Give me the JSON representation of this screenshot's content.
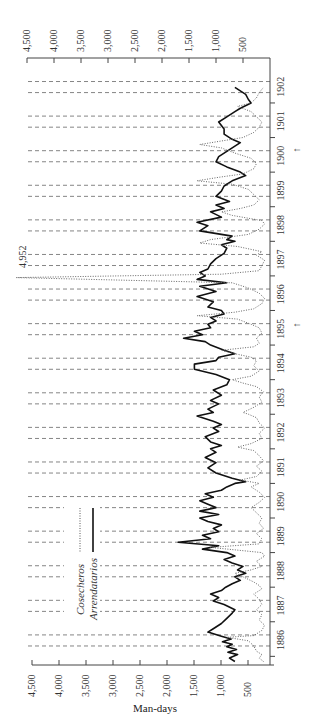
{
  "chart_data": {
    "type": "line",
    "orientation": "rotated-90 (time runs bottom-to-top, values increase right-to-left)",
    "title": "",
    "xlabel": "",
    "ylabel": "Man-days",
    "value_axis": {
      "label": "Man-days",
      "range": [
        0,
        4500
      ],
      "ticks": [
        4500,
        4000,
        3500,
        3000,
        2500,
        2000,
        1500,
        1000,
        500
      ],
      "tick_labels": [
        "4,500",
        "4,000",
        "3,500",
        "3,000",
        "2,500",
        "2,000",
        "1,500",
        "1,000",
        "500"
      ]
    },
    "time_axis": {
      "categories": [
        "1886",
        "1887",
        "1888",
        "1889",
        "1890",
        "1891",
        "1892",
        "1893",
        "1894",
        "1895",
        "1896",
        "1897",
        "1898",
        "1899",
        "1900",
        "1901",
        "1902"
      ],
      "range": [
        1885.75,
        1903.3
      ]
    },
    "grid": "dashed reference lines in pairs within each year",
    "legend": {
      "position": "inside, lower-left",
      "entries": [
        {
          "name": "Cosecheros",
          "style": "dotted"
        },
        {
          "name": "Arrendatarios",
          "style": "solid"
        }
      ]
    },
    "annotations": [
      {
        "text": "4,952",
        "at_year": 1897.0,
        "note": "Cosecheros peak off-scale"
      },
      {
        "text": "↑",
        "at_year": 1894.6,
        "note": "marker below 1895"
      },
      {
        "text": "↑",
        "at_year": 1900.2,
        "note": "marker near 1900"
      }
    ],
    "series": [
      {
        "name": "Arrendatarios",
        "style": "solid",
        "points": [
          [
            1885.85,
            650
          ],
          [
            1885.95,
            750
          ],
          [
            1886.05,
            600
          ],
          [
            1886.12,
            780
          ],
          [
            1886.2,
            620
          ],
          [
            1886.28,
            800
          ],
          [
            1886.35,
            700
          ],
          [
            1886.42,
            880
          ],
          [
            1886.5,
            720
          ],
          [
            1886.58,
            900
          ],
          [
            1886.7,
            1150
          ],
          [
            1886.8,
            1050
          ],
          [
            1886.95,
            900
          ],
          [
            1887.1,
            800
          ],
          [
            1887.25,
            700
          ],
          [
            1887.35,
            650
          ],
          [
            1887.5,
            850
          ],
          [
            1887.6,
            1050
          ],
          [
            1887.7,
            950
          ],
          [
            1887.8,
            1100
          ],
          [
            1887.9,
            900
          ],
          [
            1888.0,
            820
          ],
          [
            1888.1,
            700
          ],
          [
            1888.2,
            550
          ],
          [
            1888.3,
            650
          ],
          [
            1888.4,
            450
          ],
          [
            1888.5,
            600
          ],
          [
            1888.6,
            500
          ],
          [
            1888.7,
            700
          ],
          [
            1888.8,
            850
          ],
          [
            1888.9,
            650
          ],
          [
            1889.0,
            800
          ],
          [
            1889.1,
            1250
          ],
          [
            1889.2,
            950
          ],
          [
            1889.3,
            1700
          ],
          [
            1889.4,
            1100
          ],
          [
            1889.5,
            1250
          ],
          [
            1889.6,
            950
          ],
          [
            1889.7,
            1050
          ],
          [
            1889.8,
            900
          ],
          [
            1889.9,
            1150
          ],
          [
            1890.0,
            1300
          ],
          [
            1890.1,
            950
          ],
          [
            1890.2,
            1300
          ],
          [
            1890.3,
            1000
          ],
          [
            1890.4,
            1150
          ],
          [
            1890.5,
            1300
          ],
          [
            1890.6,
            1050
          ],
          [
            1890.7,
            1200
          ],
          [
            1890.8,
            900
          ],
          [
            1890.9,
            800
          ],
          [
            1891.0,
            650
          ],
          [
            1891.05,
            450
          ],
          [
            1891.15,
            700
          ],
          [
            1891.3,
            1000
          ],
          [
            1891.45,
            1150
          ],
          [
            1891.6,
            1000
          ],
          [
            1891.75,
            1200
          ],
          [
            1891.9,
            1000
          ],
          [
            1892.0,
            1100
          ],
          [
            1892.1,
            900
          ],
          [
            1892.2,
            1100
          ],
          [
            1892.35,
            1200
          ],
          [
            1892.5,
            950
          ],
          [
            1892.6,
            1050
          ],
          [
            1892.7,
            900
          ],
          [
            1892.8,
            1050
          ],
          [
            1892.95,
            1350
          ],
          [
            1893.05,
            1050
          ],
          [
            1893.15,
            1150
          ],
          [
            1893.3,
            950
          ],
          [
            1893.4,
            1100
          ],
          [
            1893.55,
            900
          ],
          [
            1893.7,
            1050
          ],
          [
            1893.85,
            800
          ],
          [
            1894.0,
            750
          ],
          [
            1894.15,
            1000
          ],
          [
            1894.3,
            1400
          ],
          [
            1894.45,
            1400
          ],
          [
            1894.55,
            1000
          ],
          [
            1894.65,
            950
          ],
          [
            1894.75,
            650
          ],
          [
            1894.85,
            850
          ],
          [
            1895.0,
            1100
          ],
          [
            1895.1,
            1200
          ],
          [
            1895.2,
            1600
          ],
          [
            1895.3,
            1250
          ],
          [
            1895.4,
            1400
          ],
          [
            1895.5,
            1100
          ],
          [
            1895.6,
            1150
          ],
          [
            1895.7,
            1000
          ],
          [
            1895.8,
            1100
          ],
          [
            1895.9,
            850
          ],
          [
            1896.0,
            900
          ],
          [
            1896.1,
            1150
          ],
          [
            1896.25,
            1050
          ],
          [
            1896.4,
            1350
          ],
          [
            1896.55,
            1000
          ],
          [
            1896.7,
            1300
          ],
          [
            1896.8,
            800
          ],
          [
            1896.9,
            1350
          ],
          [
            1897.0,
            1200
          ],
          [
            1897.1,
            1300
          ],
          [
            1897.2,
            1150
          ],
          [
            1897.35,
            1100
          ],
          [
            1897.5,
            1000
          ],
          [
            1897.65,
            850
          ],
          [
            1897.8,
            800
          ],
          [
            1897.9,
            900
          ],
          [
            1898.0,
            650
          ],
          [
            1898.05,
            800
          ],
          [
            1898.15,
            700
          ],
          [
            1898.3,
            1300
          ],
          [
            1898.45,
            1150
          ],
          [
            1898.55,
            1350
          ],
          [
            1898.7,
            900
          ],
          [
            1898.85,
            1100
          ],
          [
            1898.95,
            850
          ],
          [
            1899.05,
            1000
          ],
          [
            1899.15,
            750
          ],
          [
            1899.3,
            1000
          ],
          [
            1899.45,
            900
          ],
          [
            1899.6,
            850
          ],
          [
            1899.75,
            700
          ],
          [
            1899.9,
            450
          ],
          [
            1900.0,
            550
          ],
          [
            1900.15,
            800
          ],
          [
            1900.3,
            1000
          ],
          [
            1900.45,
            950
          ],
          [
            1900.6,
            800
          ],
          [
            1900.7,
            700
          ],
          [
            1900.85,
            550
          ],
          [
            1900.95,
            700
          ],
          [
            1901.1,
            850
          ],
          [
            1901.25,
            850
          ],
          [
            1901.45,
            950
          ],
          [
            1901.6,
            800
          ],
          [
            1901.75,
            650
          ],
          [
            1901.85,
            550
          ],
          [
            1902.0,
            350
          ],
          [
            1902.1,
            400
          ],
          [
            1902.25,
            450
          ],
          [
            1902.45,
            650
          ]
        ]
      },
      {
        "name": "Cosecheros",
        "style": "dotted",
        "points": [
          [
            1885.85,
            120
          ],
          [
            1885.95,
            200
          ],
          [
            1886.05,
            150
          ],
          [
            1886.15,
            250
          ],
          [
            1886.3,
            300
          ],
          [
            1886.45,
            400
          ],
          [
            1886.55,
            800
          ],
          [
            1886.6,
            300
          ],
          [
            1886.75,
            150
          ],
          [
            1886.9,
            100
          ],
          [
            1887.05,
            200
          ],
          [
            1887.2,
            150
          ],
          [
            1887.35,
            250
          ],
          [
            1887.5,
            150
          ],
          [
            1887.65,
            200
          ],
          [
            1887.8,
            300
          ],
          [
            1887.95,
            150
          ],
          [
            1888.05,
            200
          ],
          [
            1888.15,
            300
          ],
          [
            1888.3,
            500
          ],
          [
            1888.4,
            650
          ],
          [
            1888.5,
            350
          ],
          [
            1888.6,
            150
          ],
          [
            1888.75,
            250
          ],
          [
            1888.9,
            100
          ],
          [
            1889.0,
            150
          ],
          [
            1889.15,
            1100
          ],
          [
            1889.25,
            200
          ],
          [
            1889.4,
            150
          ],
          [
            1889.55,
            250
          ],
          [
            1889.7,
            120
          ],
          [
            1889.85,
            200
          ],
          [
            1890.0,
            150
          ],
          [
            1890.15,
            250
          ],
          [
            1890.3,
            350
          ],
          [
            1890.45,
            200
          ],
          [
            1890.6,
            100
          ],
          [
            1890.75,
            200
          ],
          [
            1890.9,
            350
          ],
          [
            1891.0,
            200
          ],
          [
            1891.1,
            550
          ],
          [
            1891.2,
            250
          ],
          [
            1891.35,
            150
          ],
          [
            1891.5,
            250
          ],
          [
            1891.65,
            120
          ],
          [
            1891.8,
            200
          ],
          [
            1891.95,
            300
          ],
          [
            1892.05,
            600
          ],
          [
            1892.15,
            350
          ],
          [
            1892.3,
            150
          ],
          [
            1892.45,
            200
          ],
          [
            1892.6,
            100
          ],
          [
            1892.75,
            200
          ],
          [
            1892.9,
            250
          ],
          [
            1893.0,
            400
          ],
          [
            1893.05,
            500
          ],
          [
            1893.2,
            300
          ],
          [
            1893.35,
            150
          ],
          [
            1893.5,
            200
          ],
          [
            1893.65,
            120
          ],
          [
            1893.8,
            250
          ],
          [
            1893.9,
            500
          ],
          [
            1894.0,
            700
          ],
          [
            1894.1,
            350
          ],
          [
            1894.25,
            200
          ],
          [
            1894.4,
            300
          ],
          [
            1894.55,
            250
          ],
          [
            1894.65,
            350
          ],
          [
            1894.75,
            650
          ],
          [
            1894.85,
            900
          ],
          [
            1894.95,
            300
          ],
          [
            1895.05,
            200
          ],
          [
            1895.2,
            250
          ],
          [
            1895.35,
            150
          ],
          [
            1895.5,
            200
          ],
          [
            1895.6,
            350
          ],
          [
            1895.75,
            600
          ],
          [
            1895.85,
            1350
          ],
          [
            1895.95,
            650
          ],
          [
            1896.05,
            300
          ],
          [
            1896.2,
            150
          ],
          [
            1896.35,
            100
          ],
          [
            1896.5,
            200
          ],
          [
            1896.65,
            400
          ],
          [
            1896.8,
            700
          ],
          [
            1896.95,
            4952
          ],
          [
            1897.05,
            900
          ],
          [
            1897.15,
            200
          ],
          [
            1897.3,
            150
          ],
          [
            1897.45,
            100
          ],
          [
            1897.6,
            250
          ],
          [
            1897.7,
            150
          ],
          [
            1897.85,
            600
          ],
          [
            1897.95,
            1300
          ],
          [
            1898.05,
            1100
          ],
          [
            1898.2,
            400
          ],
          [
            1898.35,
            200
          ],
          [
            1898.5,
            100
          ],
          [
            1898.6,
            150
          ],
          [
            1898.75,
            700
          ],
          [
            1898.85,
            900
          ],
          [
            1898.95,
            550
          ],
          [
            1899.05,
            300
          ],
          [
            1899.2,
            200
          ],
          [
            1899.35,
            300
          ],
          [
            1899.5,
            400
          ],
          [
            1899.65,
            700
          ],
          [
            1899.75,
            1350
          ],
          [
            1899.85,
            950
          ],
          [
            1899.95,
            500
          ],
          [
            1900.1,
            300
          ],
          [
            1900.25,
            250
          ],
          [
            1900.4,
            350
          ],
          [
            1900.55,
            650
          ],
          [
            1900.7,
            900
          ],
          [
            1900.8,
            1300
          ],
          [
            1900.9,
            900
          ],
          [
            1901.0,
            500
          ],
          [
            1901.15,
            300
          ],
          [
            1901.3,
            200
          ],
          [
            1901.45,
            150
          ],
          [
            1901.6,
            250
          ],
          [
            1901.75,
            350
          ],
          [
            1901.9,
            600
          ],
          [
            1902.0,
            350
          ],
          [
            1902.15,
            250
          ],
          [
            1902.3,
            200
          ],
          [
            1902.45,
            120
          ]
        ]
      }
    ]
  },
  "labels": {
    "axis_title": "Man-days",
    "legend_cosecheros": "Cosecheros",
    "legend_arrendatarios": "Arrendatarios",
    "annotation_peak": "4,952"
  }
}
